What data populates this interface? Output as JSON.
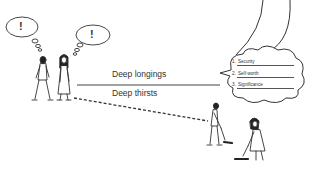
{
  "labels": {
    "top_line": "Deep longings",
    "bottom_line": "Deep thirsts"
  },
  "thought_bubbles": {
    "man": "!",
    "woman": "!"
  },
  "cloud_list": {
    "items": [
      {
        "number": "1.",
        "text": "Security"
      },
      {
        "number": "2.",
        "text": "Self-worth"
      },
      {
        "number": "3.",
        "text": "Significance"
      }
    ]
  },
  "colors": {
    "line": "#333333",
    "background": "#ffffff"
  }
}
